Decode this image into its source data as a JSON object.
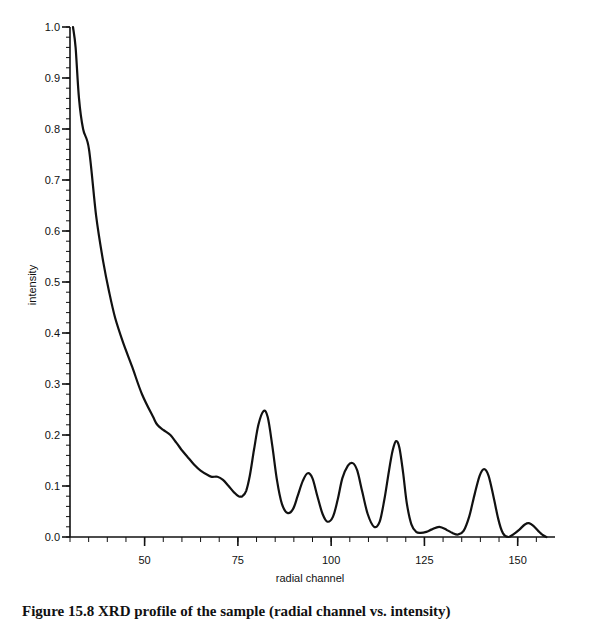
{
  "figure": {
    "caption": "Figure 15.8  XRD profile of the sample  (radial channel vs. intensity)"
  },
  "chart_data": {
    "type": "line",
    "title": "",
    "xlabel": "radial channel",
    "ylabel": "intensity",
    "xlim": [
      30,
      160
    ],
    "ylim": [
      0.0,
      1.0
    ],
    "grid": false,
    "legend": null,
    "x_ticks": [
      50,
      75,
      100,
      125,
      150
    ],
    "x_tick_labels": [
      "50",
      "75",
      "100",
      "125",
      "150"
    ],
    "x_minor_step": 5,
    "y_ticks": [
      0.0,
      0.1,
      0.2,
      0.3,
      0.4,
      0.5,
      0.6,
      0.7,
      0.8,
      0.9,
      1.0
    ],
    "y_tick_labels": [
      "0.0",
      "0.1",
      "0.2",
      "0.3",
      "0.4",
      "0.5",
      "0.6",
      "0.7",
      "0.8",
      "0.9",
      "1.0"
    ],
    "y_minor_step": 0.02,
    "series": [
      {
        "name": "intensity",
        "color": "#111111",
        "x": [
          30.8,
          31.5,
          32.4,
          33.5,
          35.1,
          37.0,
          38.9,
          40.5,
          42.1,
          44.3,
          46.7,
          49.3,
          52.3,
          53.4,
          55.0,
          56.9,
          58.5,
          60.0,
          61.5,
          63.5,
          65.0,
          66.8,
          68.0,
          69.5,
          71.0,
          72.5,
          74.0,
          75.2,
          76.2,
          77.2,
          78.2,
          79.3,
          80.5,
          81.9,
          83.0,
          84.2,
          85.5,
          86.8,
          88.3,
          89.8,
          91.0,
          92.4,
          93.7,
          95.0,
          96.3,
          97.7,
          99.0,
          100.5,
          101.8,
          103.0,
          104.5,
          105.8,
          107.0,
          108.3,
          109.8,
          111.5,
          113.0,
          114.3,
          115.5,
          116.5,
          117.4,
          118.3,
          119.3,
          120.3,
          121.5,
          122.8,
          124.0,
          125.5,
          127.0,
          129.0,
          131.0,
          132.5,
          134.0,
          135.5,
          137.0,
          138.5,
          139.8,
          141.0,
          142.2,
          143.5,
          144.8,
          146.0,
          147.5,
          149.0,
          150.5,
          152.0,
          153.0,
          154.2,
          155.5,
          156.7,
          157.7
        ],
        "y": [
          1.0,
          0.96,
          0.86,
          0.8,
          0.76,
          0.63,
          0.54,
          0.48,
          0.43,
          0.38,
          0.333,
          0.28,
          0.235,
          0.22,
          0.21,
          0.2,
          0.185,
          0.17,
          0.157,
          0.14,
          0.13,
          0.122,
          0.118,
          0.118,
          0.112,
          0.1,
          0.087,
          0.08,
          0.08,
          0.09,
          0.12,
          0.17,
          0.22,
          0.247,
          0.235,
          0.18,
          0.11,
          0.065,
          0.047,
          0.055,
          0.08,
          0.11,
          0.125,
          0.115,
          0.08,
          0.045,
          0.03,
          0.04,
          0.075,
          0.115,
          0.14,
          0.145,
          0.13,
          0.09,
          0.045,
          0.02,
          0.03,
          0.075,
          0.13,
          0.17,
          0.188,
          0.175,
          0.125,
          0.065,
          0.025,
          0.01,
          0.008,
          0.01,
          0.015,
          0.02,
          0.014,
          0.008,
          0.005,
          0.012,
          0.04,
          0.085,
          0.12,
          0.133,
          0.12,
          0.08,
          0.035,
          0.008,
          0.0,
          0.006,
          0.015,
          0.025,
          0.027,
          0.022,
          0.012,
          0.004,
          0.0
        ]
      }
    ],
    "peaks": [
      {
        "x": 81.9,
        "y": 0.247
      },
      {
        "x": 93.7,
        "y": 0.125
      },
      {
        "x": 105.8,
        "y": 0.145
      },
      {
        "x": 117.4,
        "y": 0.188
      },
      {
        "x": 129.0,
        "y": 0.02
      },
      {
        "x": 141.0,
        "y": 0.133
      },
      {
        "x": 153.0,
        "y": 0.027
      }
    ]
  }
}
